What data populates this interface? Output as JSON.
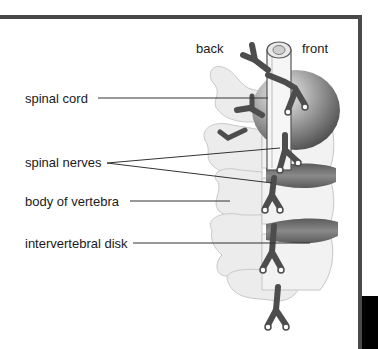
{
  "diagram": {
    "orientation_labels": {
      "back": "back",
      "front": "front"
    },
    "labels": [
      {
        "id": "spinal-cord",
        "text": "spinal cord"
      },
      {
        "id": "spinal-nerves",
        "text": "spinal nerves"
      },
      {
        "id": "body-of-vertebra",
        "text": "body of vertebra"
      },
      {
        "id": "intervertebral-disk",
        "text": "intervertebral disk"
      }
    ],
    "colors": {
      "frame": "#474747",
      "nerve": "#4d4d4d",
      "disk": "#6e6e6e",
      "bone": "#ececec",
      "leader_line": "#333333"
    }
  }
}
